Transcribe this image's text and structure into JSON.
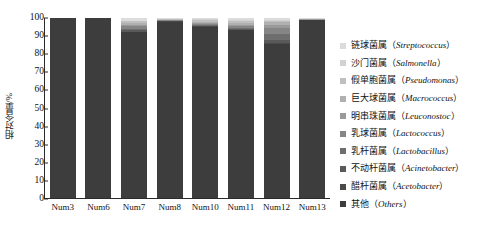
{
  "chart_data": {
    "type": "bar",
    "stacked": true,
    "title": "",
    "xlabel": "",
    "ylabel": "相对含量/%",
    "ylim": [
      0,
      100
    ],
    "yticks": [
      0,
      10,
      20,
      30,
      40,
      50,
      60,
      70,
      80,
      90,
      100
    ],
    "grid": false,
    "legend_position": "right",
    "categories": [
      "Num3",
      "Num6",
      "Num7",
      "Num8",
      "Num10",
      "Num11",
      "Num12",
      "Num13"
    ],
    "series": [
      {
        "name": "链球菌属（Streptococcus）",
        "color": "#dcdcdc",
        "values": [
          0,
          0,
          1.2,
          0.3,
          0.6,
          1.0,
          0.8,
          0.3
        ]
      },
      {
        "name": "沙门菌属（Salmonella）",
        "color": "#d2d2d2",
        "values": [
          0,
          0,
          0.5,
          0.2,
          0.4,
          0.5,
          0.4,
          0.2
        ]
      },
      {
        "name": "假单胞菌属（Pseudomonas）",
        "color": "#c0c0c0",
        "values": [
          0,
          0,
          1.0,
          0.3,
          0.8,
          1.2,
          1.0,
          0.2
        ]
      },
      {
        "name": "巨大球菌属（Macrococcus）",
        "color": "#b0b0b0",
        "values": [
          0,
          0,
          0.8,
          0.2,
          0.6,
          0.8,
          1.4,
          0.1
        ]
      },
      {
        "name": "明串珠菌属（Leuconostoc）",
        "color": "#9a9a9a",
        "values": [
          0,
          0,
          1.0,
          0.2,
          0.6,
          0.8,
          2.0,
          0.1
        ]
      },
      {
        "name": "乳球菌属（Lactococcus）",
        "color": "#858585",
        "values": [
          0,
          0,
          1.2,
          0.2,
          0.6,
          0.9,
          3.0,
          0.1
        ]
      },
      {
        "name": "乳杆菌属（Lactobacillus）",
        "color": "#6e6e6e",
        "values": [
          0,
          0,
          1.0,
          0.2,
          0.5,
          0.7,
          3.2,
          0.1
        ]
      },
      {
        "name": "不动杆菌属（Acinetobacter）",
        "color": "#5a5a5a",
        "values": [
          0,
          0,
          0.6,
          0.2,
          0.4,
          0.5,
          1.6,
          0.1
        ]
      },
      {
        "name": "醋杆菌属（Acetobacter）",
        "color": "#4a4a4a",
        "values": [
          0,
          0,
          0.4,
          0.1,
          0.3,
          0.3,
          0.9,
          0.1
        ]
      },
      {
        "name": "其他（Others）",
        "color": "#3d3d3d",
        "values": [
          99.3,
          99.3,
          91.6,
          97.5,
          94.5,
          92.6,
          85.0,
          98.2
        ]
      }
    ],
    "legend_entries": [
      {
        "label_cn": "链球菌属",
        "label_latin": "Streptococcus",
        "color": "#dcdcdc"
      },
      {
        "label_cn": "沙门菌属",
        "label_latin": "Salmonella",
        "color": "#d2d2d2"
      },
      {
        "label_cn": "假单胞菌属",
        "label_latin": "Pseudomonas",
        "color": "#c0c0c0"
      },
      {
        "label_cn": "巨大球菌属",
        "label_latin": "Macrococcus",
        "color": "#b0b0b0"
      },
      {
        "label_cn": "明串珠菌属",
        "label_latin": "Leuconostoc",
        "color": "#9a9a9a"
      },
      {
        "label_cn": "乳球菌属",
        "label_latin": "Lactococcus",
        "color": "#858585"
      },
      {
        "label_cn": "乳杆菌属",
        "label_latin": "Lactobacillus",
        "color": "#6e6e6e"
      },
      {
        "label_cn": "不动杆菌属",
        "label_latin": "Acinetobacter",
        "color": "#5a5a5a"
      },
      {
        "label_cn": "醋杆菌属",
        "label_latin": "Acetobacter",
        "color": "#4a4a4a"
      },
      {
        "label_cn": "其他",
        "label_latin": "Others",
        "color": "#3d3d3d"
      }
    ]
  }
}
